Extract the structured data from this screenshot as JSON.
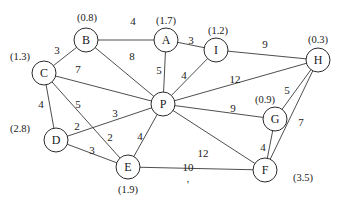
{
  "diagram": {
    "type": "weighted-undirected-graph",
    "nodes": [
      {
        "id": "A",
        "label": "A",
        "value": "(1.7)",
        "x": 166,
        "y": 40,
        "vx": 166,
        "vy": 20
      },
      {
        "id": "B",
        "label": "B",
        "value": "(0.8)",
        "x": 86,
        "y": 40,
        "vx": 87,
        "vy": 17
      },
      {
        "id": "C",
        "label": "C",
        "value": "(1.3)",
        "x": 44,
        "y": 73,
        "vx": 20,
        "vy": 56
      },
      {
        "id": "D",
        "label": "D",
        "value": "(2.8)",
        "x": 56,
        "y": 140,
        "vx": 20,
        "vy": 128
      },
      {
        "id": "E",
        "label": "E",
        "value": "(1.9)",
        "x": 128,
        "y": 167,
        "vx": 128,
        "vy": 189
      },
      {
        "id": "F",
        "label": "F",
        "value": "(3.5)",
        "x": 265,
        "y": 170,
        "vx": 303,
        "vy": 177
      },
      {
        "id": "G",
        "label": "G",
        "value": "(0.9)",
        "x": 275,
        "y": 119,
        "vx": 265,
        "vy": 99
      },
      {
        "id": "H",
        "label": "H",
        "value": "(0.3)",
        "x": 318,
        "y": 60,
        "vx": 318,
        "vy": 39
      },
      {
        "id": "I",
        "label": "I",
        "value": "(1.2)",
        "x": 216,
        "y": 50,
        "vx": 218,
        "vy": 30
      },
      {
        "id": "P",
        "label": "P",
        "value": "",
        "x": 163,
        "y": 104,
        "vx": 0,
        "vy": 0
      }
    ],
    "edges": [
      {
        "from": "B",
        "to": "A",
        "weight": "4",
        "lx": 133,
        "ly": 21
      },
      {
        "from": "A",
        "to": "I",
        "weight": "3",
        "lx": 191,
        "ly": 40
      },
      {
        "from": "I",
        "to": "H",
        "weight": "9",
        "lx": 265,
        "ly": 44
      },
      {
        "from": "B",
        "to": "C",
        "weight": "3",
        "lx": 57,
        "ly": 50
      },
      {
        "from": "B",
        "to": "P",
        "weight": "8",
        "lx": 132,
        "ly": 56
      },
      {
        "from": "A",
        "to": "P",
        "weight": "5",
        "lx": 159,
        "ly": 70
      },
      {
        "from": "I",
        "to": "P",
        "weight": "4",
        "lx": 184,
        "ly": 75
      },
      {
        "from": "C",
        "to": "P",
        "weight": "7",
        "lx": 78,
        "ly": 69
      },
      {
        "from": "P",
        "to": "H",
        "weight": "12",
        "lx": 235,
        "ly": 79
      },
      {
        "from": "C",
        "to": "D",
        "weight": "4",
        "lx": 41,
        "ly": 104
      },
      {
        "from": "C",
        "to": "E",
        "weight": "5",
        "lx": 78,
        "ly": 104
      },
      {
        "from": "D",
        "to": "P",
        "weight": "3",
        "lx": 115,
        "ly": 113
      },
      {
        "from": "D",
        "to": "P_near",
        "weight": "2",
        "lx": 77,
        "ly": 126
      },
      {
        "from": "C_E_lower",
        "to": "E",
        "weight": "2",
        "lx": 110,
        "ly": 137
      },
      {
        "from": "D",
        "to": "E",
        "weight": "3",
        "lx": 92,
        "ly": 150
      },
      {
        "from": "P",
        "to": "E",
        "weight": "4",
        "lx": 140,
        "ly": 136
      },
      {
        "from": "P",
        "to": "G",
        "weight": "9",
        "lx": 233,
        "ly": 108
      },
      {
        "from": "G",
        "to": "H",
        "weight": "5",
        "lx": 287,
        "ly": 90
      },
      {
        "from": "H",
        "to": "F",
        "weight": "7",
        "lx": 301,
        "ly": 122
      },
      {
        "from": "G",
        "to": "F",
        "weight": "4",
        "lx": 263,
        "ly": 147
      },
      {
        "from": "P",
        "to": "F",
        "weight": "12",
        "lx": 203,
        "ly": 153
      },
      {
        "from": "E",
        "to": "F",
        "weight": "10",
        "lx": 188,
        "ly": 167
      }
    ],
    "stray_mark": {
      "text": "'",
      "x": 188,
      "y": 184
    }
  }
}
